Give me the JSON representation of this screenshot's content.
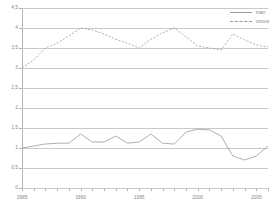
{
  "chart_data": {
    "type": "line",
    "title": "",
    "subtitle": "",
    "xlabel": "",
    "ylabel": "",
    "xlim": [
      1985,
      2006
    ],
    "ylim": [
      0,
      4.5
    ],
    "grid": true,
    "legend_position": "top-right",
    "x": [
      1985,
      1986,
      1987,
      1988,
      1989,
      1990,
      1991,
      1992,
      1993,
      1994,
      1995,
      1996,
      1997,
      1998,
      1999,
      2000,
      2001,
      2002,
      2003,
      2004,
      2005,
      2006
    ],
    "xtick_labels": [
      "1985",
      "1990",
      "1995",
      "2000",
      "2005"
    ],
    "xtick_values": [
      1985,
      1990,
      1995,
      2000,
      2005
    ],
    "ytick_labels": [
      "0",
      "0,5",
      "1",
      "1,5",
      "2",
      "2,5",
      "3",
      "3,5",
      "4",
      "4,5"
    ],
    "ytick_values": [
      0,
      0.5,
      1,
      1.5,
      2,
      2.5,
      3,
      3.5,
      4,
      4.5
    ],
    "series": [
      {
        "name": "man",
        "style": "solid",
        "color": "#9a9a9a",
        "values": [
          1.0,
          1.05,
          1.1,
          1.12,
          1.12,
          1.35,
          1.15,
          1.15,
          1.3,
          1.12,
          1.15,
          1.35,
          1.12,
          1.1,
          1.4,
          1.47,
          1.45,
          1.3,
          0.8,
          0.7,
          0.8,
          1.05
        ]
      },
      {
        "name": "vrouw",
        "style": "dashed",
        "color": "#9a9a9a",
        "values": [
          3.0,
          3.2,
          3.5,
          3.62,
          3.8,
          4.0,
          3.95,
          3.85,
          3.72,
          3.62,
          3.5,
          3.72,
          3.88,
          4.0,
          3.78,
          3.55,
          3.5,
          3.45,
          3.85,
          3.7,
          3.58,
          3.52
        ]
      }
    ],
    "series_extra": {
      "man_tail": [
        1.2,
        1.38,
        1.38,
        1.35,
        1.3,
        1.22,
        1.18
      ],
      "vrouw_tail": [
        3.5,
        3.48,
        3.62,
        3.68,
        3.55,
        3.18,
        2.82
      ]
    }
  },
  "legend": {
    "items": [
      {
        "label": "man",
        "style": "solid"
      },
      {
        "label": "vrouw",
        "style": "dashed"
      }
    ]
  }
}
